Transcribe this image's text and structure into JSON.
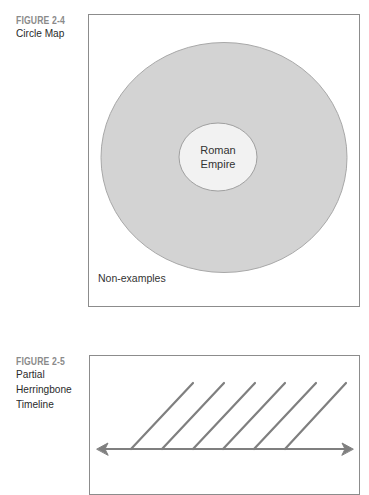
{
  "figures": [
    {
      "number": "FIGURE 2-4",
      "caption_lines": [
        "Circle Map"
      ],
      "type": "circle-map",
      "inner_circle_label_lines": [
        "Roman",
        "Empire"
      ],
      "outer_region_label": "Non-examples",
      "colors": {
        "outer_circle": "#d3d3d3",
        "inner_circle": "#f2f2f2",
        "frame": "#8c8c8c"
      }
    },
    {
      "number": "FIGURE 2-5",
      "caption_lines": [
        "Partial",
        "Herringbone",
        "Timeline"
      ],
      "type": "herringbone-timeline",
      "branch_count": 6,
      "colors": {
        "line": "#7f7f7f",
        "frame": "#8c8c8c"
      }
    }
  ]
}
